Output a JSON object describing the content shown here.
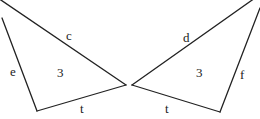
{
  "diagram": {
    "stroke_color": "#222222",
    "background": "#ffffff",
    "left_triangle": {
      "edges": [
        {
          "label": "c",
          "x1": -2,
          "y1": -2,
          "x2": 126,
          "y2": 85,
          "lx": 66,
          "ly": 40
        },
        {
          "label": "e",
          "x1": 2,
          "y1": 18,
          "x2": 37,
          "y2": 111,
          "lx": 10,
          "ly": 76
        },
        {
          "label": "t",
          "x1": 37,
          "y1": 111,
          "x2": 126,
          "y2": 85,
          "lx": 80,
          "ly": 113
        }
      ],
      "interior_label": "3",
      "ix": 57,
      "iy": 77
    },
    "right_triangle": {
      "edges": [
        {
          "label": "d",
          "x1": 132,
          "y1": 85,
          "x2": 255,
          "y2": -2,
          "lx": 183,
          "ly": 42
        },
        {
          "label": "f",
          "x1": 260,
          "y1": 8,
          "x2": 220,
          "y2": 112,
          "lx": 240,
          "ly": 79
        },
        {
          "label": "t",
          "x1": 132,
          "y1": 85,
          "x2": 220,
          "y2": 112,
          "lx": 165,
          "ly": 113
        }
      ],
      "interior_label": "3",
      "ix": 196,
      "iy": 77
    }
  }
}
